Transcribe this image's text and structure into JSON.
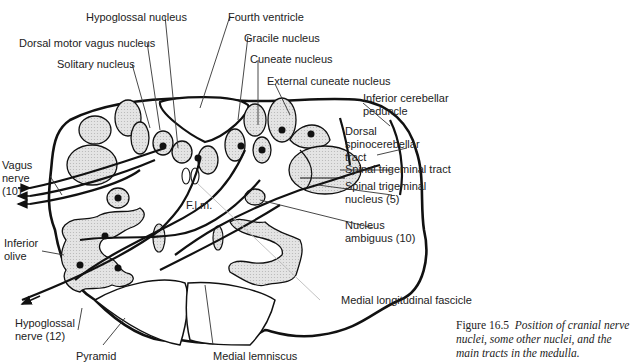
{
  "figure": {
    "number": "Figure 16.5",
    "caption": "Position of cranial nerve nuclei, some other nuclei, and the main tracts in the medulla."
  },
  "labels": {
    "hypoglossal_nucleus": "Hypoglossal nucleus",
    "fourth_ventricle": "Fourth ventricle",
    "dorsal_motor_vagus_nucleus": "Dorsal motor vagus nucleus",
    "gracile_nucleus": "Gracile nucleus",
    "solitary_nucleus": "Solitary nucleus",
    "cuneate_nucleus": "Cuneate nucleus",
    "external_cuneate_nucleus": "External cuneate nucleus",
    "inferior_cerebellar_peduncle_1": "Inferior cerebellar",
    "inferior_cerebellar_peduncle_2": "peduncle",
    "dorsal_spinocerebellar_1": "Dorsal",
    "dorsal_spinocerebellar_2": "spinocerebellar",
    "dorsal_spinocerebellar_3": "tract",
    "vagus_nerve_1": "Vagus",
    "vagus_nerve_2": "nerve",
    "vagus_nerve_3": "(10)",
    "spinal_trigeminal_tract": "Spinal trigeminal tract",
    "spinal_trigeminal_nucleus_1": "Spinal trigeminal",
    "spinal_trigeminal_nucleus_2": "nucleus (5)",
    "flm": "F.l.m.",
    "nucleus_ambiguus_1": "Nucleus",
    "nucleus_ambiguus_2": "ambiguus (10)",
    "inferior_olive_1": "Inferior",
    "inferior_olive_2": "olive",
    "medial_longitudinal_fascicle": "Medial longitudinal fascicle",
    "hypoglossal_nerve_1": "Hypoglossal",
    "hypoglossal_nerve_2": "nerve (12)",
    "pyramid": "Pyramid",
    "medial_lemniscus": "Medial lemniscus"
  },
  "colors": {
    "outline": "#111111",
    "nucleus_fill": "#d9d9d9",
    "leader_line": "#333333",
    "faint_leader": "#bbbbbb"
  }
}
